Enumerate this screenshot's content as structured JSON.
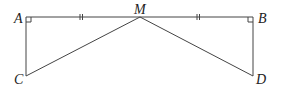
{
  "diagram": {
    "points": {
      "A": {
        "label": "A",
        "x": 26,
        "y": 17
      },
      "M": {
        "label": "M",
        "x": 140,
        "y": 17
      },
      "B": {
        "label": "B",
        "x": 253,
        "y": 17
      },
      "C": {
        "label": "C",
        "x": 26,
        "y": 76
      },
      "D": {
        "label": "D",
        "x": 253,
        "y": 76
      }
    },
    "segments": [
      "AM",
      "MB",
      "AC",
      "BD",
      "MC",
      "MD"
    ],
    "right_angles": [
      "A",
      "B"
    ],
    "equal_marks": {
      "AM": "||",
      "MB": "||"
    }
  }
}
